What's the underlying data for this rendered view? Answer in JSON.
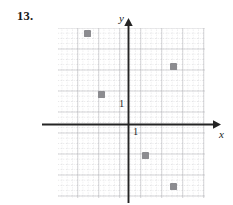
{
  "figure": {
    "problem_number": "13.",
    "axis_labels": {
      "x": "x",
      "y": "y"
    },
    "tick_labels": {
      "x_one": "1",
      "y_one": "1"
    }
  },
  "chart_data": {
    "type": "scatter",
    "title": "",
    "xlabel": "x",
    "ylabel": "y",
    "grid": true,
    "legend": false,
    "unit_px": 21,
    "origin_px": [
      128,
      124
    ],
    "xlim": [
      -3.3,
      3.7
    ],
    "ylim": [
      -3.5,
      4.6
    ],
    "xticks": [
      1
    ],
    "yticks": [
      1
    ],
    "points": [
      {
        "x": -2,
        "y": 4.3,
        "px": 87,
        "py": 33
      },
      {
        "x": 2.1,
        "y": 2.8,
        "px": 173,
        "py": 66
      },
      {
        "x": -1.3,
        "y": 1.4,
        "px": 101,
        "py": 94
      },
      {
        "x": 0.8,
        "y": -1.5,
        "px": 145,
        "py": 155
      },
      {
        "x": 2.1,
        "y": -3,
        "px": 173,
        "py": 186
      }
    ]
  }
}
